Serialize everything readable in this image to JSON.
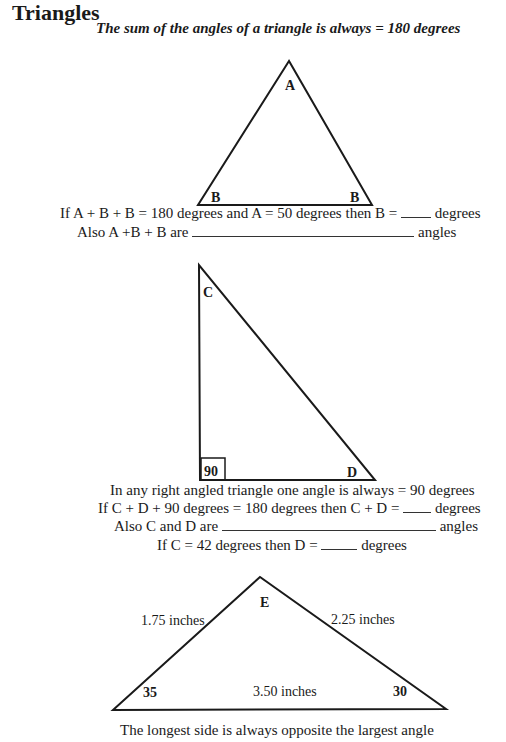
{
  "header": {
    "title": "Triangles",
    "subtitle": "The sum of the angles of a triangle is always = 180 degrees"
  },
  "triangle1": {
    "apex_label": "A",
    "left_label": "B",
    "right_label": "B",
    "question1_pre": "If A + B + B = 180 degrees and A = 50 degrees then B =",
    "question1_post": "degrees",
    "question2_pre": "Also A +B + B are",
    "question2_post": "angles"
  },
  "triangle2": {
    "top_label": "C",
    "right_angle_label": "90",
    "bottom_right_label": "D",
    "statement": "In any right angled triangle one angle is always = 90 degrees",
    "question1_pre": "If C + D + 90 degrees = 180 degrees then C + D =",
    "question1_post": "degrees",
    "question2_pre": "Also C and D are",
    "question2_post": "angles",
    "question3_pre": "If C = 42 degrees then D =",
    "question3_post": "degrees"
  },
  "triangle3": {
    "apex_label": "E",
    "left_angle": "35",
    "right_angle": "30",
    "left_side": "1.75 inches",
    "right_side": "2.25 inches",
    "base_side": "3.50 inches",
    "statement": "The longest side is always opposite the largest angle"
  }
}
